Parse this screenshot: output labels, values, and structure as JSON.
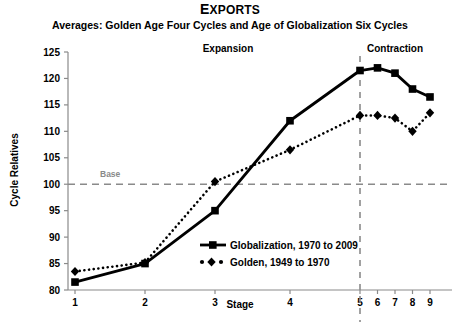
{
  "chart_data": {
    "type": "line",
    "title": "EXPORTS",
    "subtitle": "Averages: Golden Age Four Cycles and Age of Globalization Six Cycles",
    "xlabel": "Stage",
    "ylabel": "Cycle Relatives",
    "categories": [
      "1",
      "2",
      "3",
      "4",
      "5",
      "6",
      "7",
      "8",
      "9"
    ],
    "x_tick_labels": [
      "1",
      "2",
      "3",
      "4",
      "5",
      "6",
      "7",
      "8",
      "9"
    ],
    "y_tick_labels": [
      "80",
      "85",
      "90",
      "95",
      "100",
      "105",
      "110",
      "115",
      "120",
      "125"
    ],
    "ylim": [
      80,
      125
    ],
    "y_tick_step": 5,
    "grid": false,
    "legend_position": "inside-center-lower",
    "series": [
      {
        "name": "Globalization, 1970 to 2009",
        "marker": "square",
        "line_style": "solid",
        "color": "#000000",
        "values": [
          81.5,
          85.0,
          95.0,
          112.0,
          121.5,
          122.0,
          121.0,
          118.0,
          116.5
        ]
      },
      {
        "name": "Golden, 1949 to 1970",
        "marker": "diamond",
        "line_style": "dotted",
        "color": "#000000",
        "values": [
          83.5,
          85.2,
          100.5,
          106.5,
          113.0,
          113.0,
          112.5,
          110.0,
          113.5
        ]
      }
    ],
    "annotations": [
      {
        "id": "expansion",
        "text": "Expansion",
        "kind": "zone-label"
      },
      {
        "id": "contraction",
        "text": "Contraction",
        "kind": "zone-label"
      },
      {
        "id": "base",
        "text": "Base",
        "kind": "reference-line-label"
      }
    ],
    "reference_lines": [
      {
        "id": "base-line",
        "orientation": "horizontal",
        "value": 100,
        "style": "dashed",
        "color": "#8a8a8a"
      },
      {
        "id": "contraction-divider",
        "orientation": "vertical",
        "value": 5,
        "style": "dashed",
        "color": "#8a8a8a"
      }
    ]
  },
  "legend": {
    "items": [
      {
        "label": "Globalization, 1970 to 2009"
      },
      {
        "label": "Golden, 1949 to 1970"
      }
    ]
  }
}
